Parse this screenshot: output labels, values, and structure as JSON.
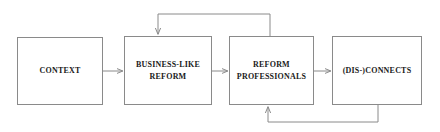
{
  "diagram": {
    "type": "flow-diagram",
    "orientation": "horizontal",
    "background_color": "#ffffff",
    "line_color": "#8a8a8a",
    "text_color": "#1a1a1a",
    "nodes": [
      {
        "id": "context",
        "label": "CONTEXT",
        "shape": "rectangle"
      },
      {
        "id": "business",
        "label": "BUSINESS-LIKE\nREFORM",
        "shape": "rectangle"
      },
      {
        "id": "reform",
        "label": "REFORM\nPROFESSIONALS",
        "shape": "rectangle"
      },
      {
        "id": "connects",
        "label": "(DIS-)CONNECTS",
        "shape": "rectangle"
      }
    ],
    "edges": [
      {
        "id": "edge-context-business",
        "from": "context",
        "to": "business",
        "style": "straight-arrow",
        "direction": "left-to-right"
      },
      {
        "id": "edge-business-reform",
        "from": "business",
        "to": "reform",
        "style": "straight-arrow",
        "direction": "left-to-right"
      },
      {
        "id": "edge-reform-connects",
        "from": "reform",
        "to": "connects",
        "style": "straight-arrow",
        "direction": "left-to-right"
      },
      {
        "id": "edge-reform-business-feedback",
        "from": "reform",
        "to": "business",
        "style": "orthogonal-feedback-arrow",
        "routing": "over-the-top"
      },
      {
        "id": "edge-connects-reform-feedback",
        "from": "connects",
        "to": "reform",
        "style": "orthogonal-feedback-arrow",
        "routing": "under-the-bottom"
      }
    ]
  }
}
